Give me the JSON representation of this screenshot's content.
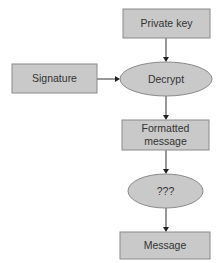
{
  "diagram": {
    "type": "flowchart",
    "colors": {
      "node_fill": "#c9c9c9",
      "node_border": "#8a8a8a",
      "edge": "#333333",
      "text": "#333333",
      "background": "#ffffff"
    },
    "nodes": [
      {
        "id": "private_key",
        "shape": "rectangle",
        "label": "Private key"
      },
      {
        "id": "signature",
        "shape": "rectangle",
        "label": "Signature"
      },
      {
        "id": "decrypt",
        "shape": "ellipse",
        "label": "Decrypt"
      },
      {
        "id": "formatted_message",
        "shape": "rectangle",
        "label_line1": "Formatted",
        "label_line2": "message"
      },
      {
        "id": "unknown",
        "shape": "ellipse",
        "label": "???"
      },
      {
        "id": "message",
        "shape": "rectangle",
        "label": "Message"
      }
    ],
    "edges": [
      {
        "from": "private_key",
        "to": "decrypt"
      },
      {
        "from": "signature",
        "to": "decrypt"
      },
      {
        "from": "decrypt",
        "to": "formatted_message"
      },
      {
        "from": "formatted_message",
        "to": "unknown"
      },
      {
        "from": "unknown",
        "to": "message"
      }
    ]
  }
}
